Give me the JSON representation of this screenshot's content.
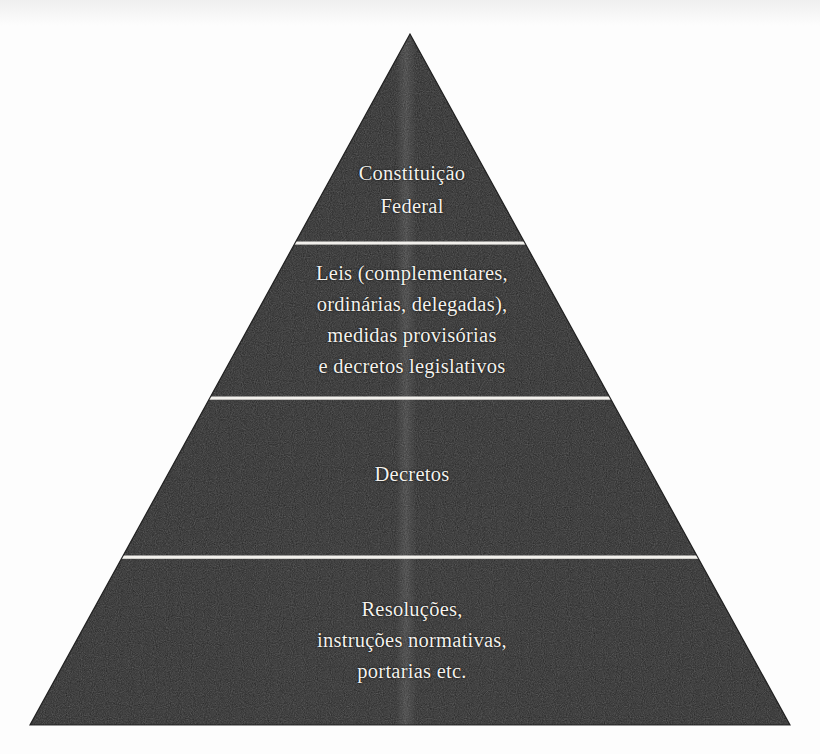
{
  "figure": {
    "kind": "hierarchy-pyramid",
    "alt_title": "Pirâmide da hierarquia das normas jurídicas",
    "background_color": "#fdfdfd",
    "body_color": "#212121",
    "text_color": "#f4f2ee",
    "divider_color": "#f2f0ec",
    "orientation": "apex-top"
  },
  "pyramid": {
    "apex": {
      "x": 410,
      "y": 34
    },
    "base_left": {
      "x": 30,
      "y": 725
    },
    "base_right": {
      "x": 790,
      "y": 725
    },
    "divider_y": [
      243,
      398,
      557
    ],
    "tiers": [
      {
        "id": "tier-1",
        "rank": 1,
        "name": "constituicao-federal",
        "lines": [
          "Constituição",
          "Federal"
        ]
      },
      {
        "id": "tier-2",
        "rank": 2,
        "name": "leis-medidas-provisorias-decretos-legislativos",
        "lines": [
          "Leis (complementares,",
          "ordinárias, delegadas),",
          "medidas provisórias",
          "e decretos legislativos"
        ]
      },
      {
        "id": "tier-3",
        "rank": 3,
        "name": "decretos",
        "lines": [
          "Decretos"
        ]
      },
      {
        "id": "tier-4",
        "rank": 4,
        "name": "resolucoes-instrucoes-normativas-portarias",
        "lines": [
          "Resoluções,",
          "instruções normativas,",
          "portarias etc."
        ]
      }
    ]
  }
}
